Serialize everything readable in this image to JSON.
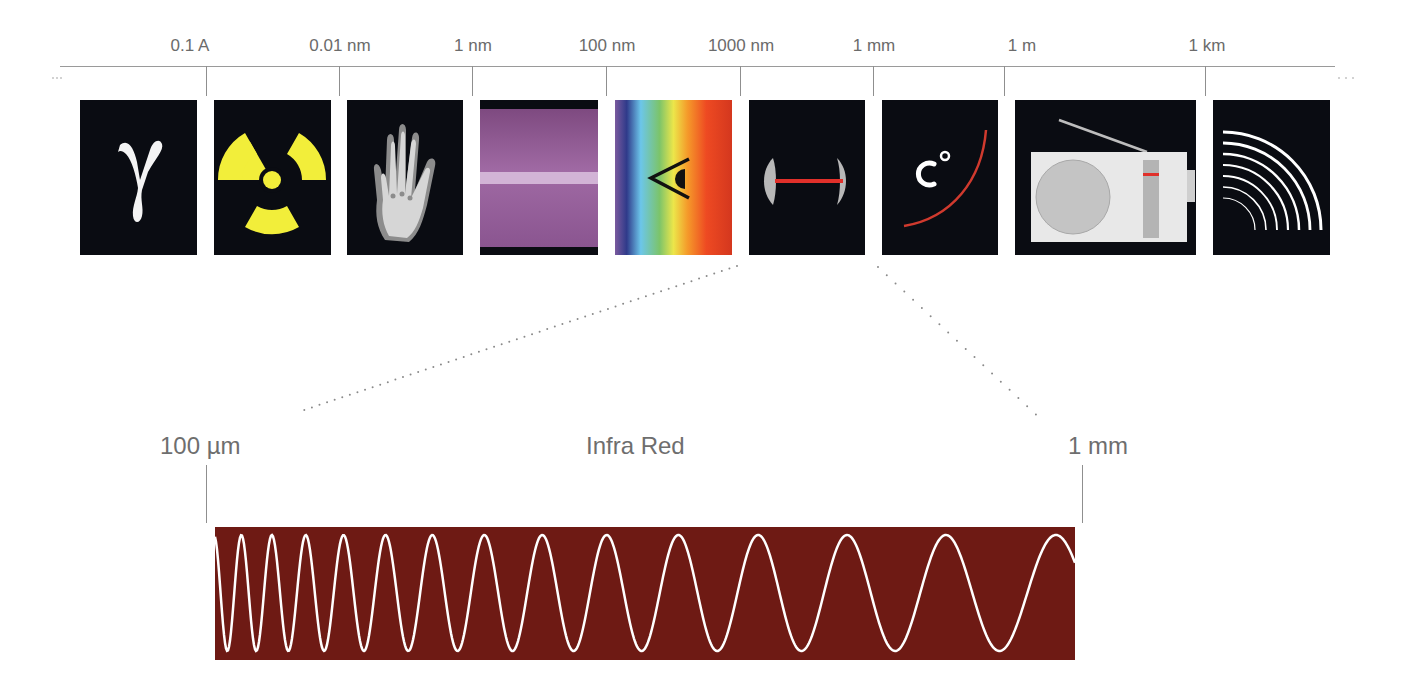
{
  "diagram": {
    "scale": {
      "labels": [
        {
          "text": "0.1 A",
          "x": 206
        },
        {
          "text": "0.01 nm",
          "x": 340
        },
        {
          "text": "1 nm",
          "x": 473
        },
        {
          "text": "100 nm",
          "x": 607
        },
        {
          "text": "1000 nm",
          "x": 741
        },
        {
          "text": "1 mm",
          "x": 874
        },
        {
          "text": "1 m",
          "x": 1004
        },
        {
          "text": "1 km",
          "x": 1205
        }
      ]
    },
    "tiles": [
      {
        "name": "gamma-rays",
        "icon": "gamma-symbol-icon"
      },
      {
        "name": "radioactivity",
        "icon": "radiation-trefoil-icon"
      },
      {
        "name": "x-rays",
        "icon": "xray-hand-icon"
      },
      {
        "name": "ultraviolet",
        "icon": "ultraviolet-light-icon"
      },
      {
        "name": "visible-light",
        "icon": "eye-rainbow-icon"
      },
      {
        "name": "infrared",
        "icon": "laser-lens-icon"
      },
      {
        "name": "microwave-heat",
        "icon": "temperature-celsius-icon"
      },
      {
        "name": "radio",
        "icon": "radio-icon"
      },
      {
        "name": "long-waves",
        "icon": "radio-waves-icon"
      }
    ],
    "detail": {
      "band_name": "Infra Red",
      "left_label": "100 µm",
      "right_label": "1 mm",
      "band_color": "#6e1a14",
      "wave_color": "#ffffff"
    },
    "colors": {
      "tile_background": "#0a0c12",
      "scale_line": "#9a9a9a",
      "label_text": "#6b6b6b",
      "radiation_yellow": "#f2ee3a",
      "laser_red": "#e0302a"
    }
  }
}
